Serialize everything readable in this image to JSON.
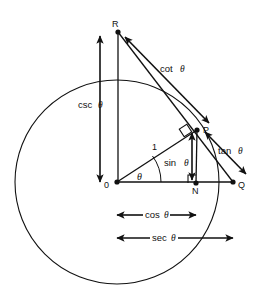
{
  "figure": {
    "type": "trigonometric-unit-circle-diagram",
    "background_color": "#ffffff",
    "stroke_color": "#111111"
  },
  "points": {
    "origin": {
      "label": "0",
      "x": 117,
      "y": 182
    },
    "P": {
      "label": "P",
      "x": 197,
      "y": 130
    },
    "Q": {
      "label": "Q",
      "x": 233,
      "y": 182
    },
    "R": {
      "label": "R",
      "x": 118,
      "y": 32
    },
    "N": {
      "label": "N",
      "x": 196,
      "y": 183
    }
  },
  "circle": {
    "center_x": 117,
    "center_y": 182,
    "radius": 102
  },
  "labels": {
    "radius_one": "1",
    "sin": "sin",
    "cos": "cos",
    "tan": "tan",
    "cot": "cot",
    "sec": "sec",
    "csc": "csc",
    "theta": "θ",
    "angle_theta": "θ"
  },
  "measures": [
    {
      "name": "csc",
      "label": "csc",
      "symbol": "θ",
      "orientation": "vertical",
      "from": [
        100,
        36
      ],
      "to": [
        100,
        182
      ]
    },
    {
      "name": "cot",
      "label": "cot",
      "symbol": "θ",
      "orientation": "diagonal",
      "from": [
        124,
        36
      ],
      "to": [
        208,
        122
      ]
    },
    {
      "name": "tan",
      "label": "tan",
      "symbol": "θ",
      "orientation": "diagonal",
      "from": [
        245,
        172
      ],
      "to": [
        205,
        132
      ]
    },
    {
      "name": "sin",
      "label": "sin",
      "symbol": "θ",
      "orientation": "vertical",
      "from": [
        192,
        133
      ],
      "to": [
        192,
        180
      ]
    },
    {
      "name": "cos",
      "label": "cos",
      "symbol": "θ",
      "orientation": "horizontal",
      "from": [
        117,
        215
      ],
      "to": [
        196,
        215
      ]
    },
    {
      "name": "sec",
      "label": "sec",
      "symbol": "θ",
      "orientation": "horizontal",
      "from": [
        117,
        238
      ],
      "to": [
        233,
        238
      ]
    }
  ],
  "markers": {
    "right_angle_at_P": true,
    "right_angle_at_N": true,
    "angle_arc_at_origin": true
  }
}
